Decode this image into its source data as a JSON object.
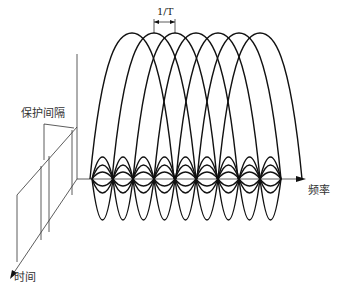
{
  "diagram": {
    "type": "OFDM spectrum with guard interval (3D illustration)",
    "labels": {
      "subcarrier_spacing": "1/T",
      "guard_interval": "保护间隔",
      "frequency_axis": "频率",
      "time_axis": "时间"
    },
    "subcarriers": {
      "count_tall_peaks": 7,
      "tall_peak_x": [
        132,
        154,
        175,
        196,
        218,
        239,
        260
      ],
      "tall_peak_top_y": 33,
      "baseline_y": 179,
      "node_x": [
        92,
        113,
        133,
        154,
        175,
        196,
        218,
        239,
        260,
        281
      ],
      "lobe_spacing_px": 21
    },
    "colors": {
      "stroke": "#111111",
      "axis": "#333333",
      "text": "#333333",
      "background": "#ffffff"
    }
  }
}
